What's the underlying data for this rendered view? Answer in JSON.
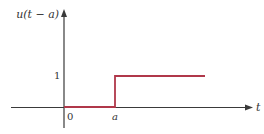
{
  "diagram": {
    "y_axis_label": "u(t − a)",
    "x_axis_label": "t",
    "origin_label": "0",
    "shift_label": "a",
    "level_label": "1",
    "colors": {
      "axis": "#3a3a3a",
      "step": "#b0384a",
      "text": "#333333"
    }
  }
}
